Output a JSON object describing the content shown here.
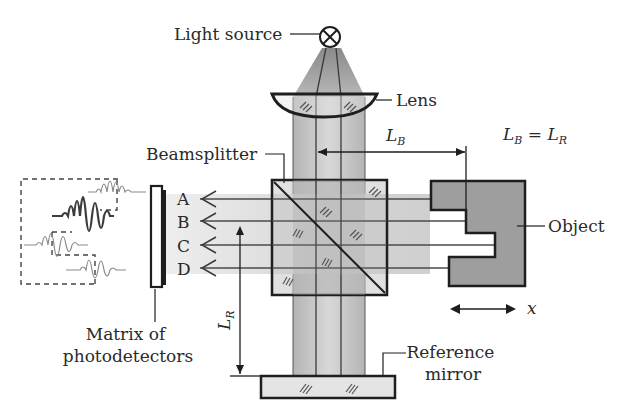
{
  "diagram": {
    "type": "optical interferometer schematic (low-coherence interferometry)",
    "labels": {
      "light_source": "Light source",
      "lens": "Lens",
      "beamsplitter": "Beamsplitter",
      "object": "Object",
      "matrix_line1": "Matrix of",
      "matrix_line2": "photodetectors",
      "reference_line1": "Reference",
      "reference_line2": "mirror"
    },
    "channels": [
      "A",
      "B",
      "C",
      "D"
    ],
    "dimensions": {
      "lb_symbol": "L",
      "lb_sub": "B",
      "lr_symbol": "L",
      "lr_sub": "R",
      "equation_l1": "L",
      "equation_s1": "B",
      "equation_eq": " = ",
      "equation_l2": "L",
      "equation_s2": "R",
      "motion_axis": "x"
    },
    "colors": {
      "stroke": "#1e1e1e",
      "beam": "#c8c8c8",
      "beam_light": "#dedede",
      "object_fill": "#9a9a9a",
      "mirror_fill": "#e4e4e4"
    }
  }
}
